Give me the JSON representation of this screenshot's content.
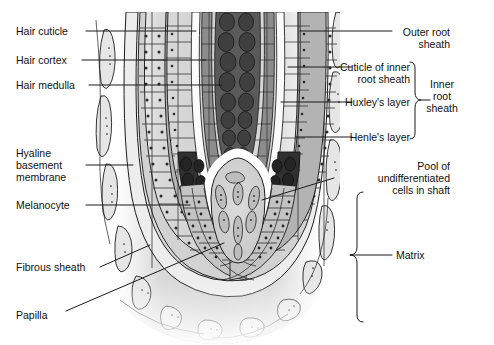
{
  "figure": {
    "type": "anatomical-diagram",
    "background_color": "#ffffff",
    "line_color": "#1a1a1a",
    "palette": {
      "paper": "#ffffff",
      "tissue_field": "#d9d9d9",
      "outer_root_sheath": "#cfcfcf",
      "inner_root_sheath": "#b5b5b5",
      "hair_cuticle_white": "#fdfdfd",
      "hair_cortex": "#8c8c8c",
      "hair_medulla": "#4c4c4c",
      "melanocyte_zone": "#333333",
      "matrix_cells": "#c2c2c2",
      "papilla": "#c9c9c9",
      "fibrous_sheath": "#e2e2e2",
      "nucleus_dot": "#2b2b2b",
      "leader_line": "#1a1a1a"
    }
  },
  "labels_left": [
    {
      "id": "hair-cuticle",
      "text": "Hair cuticle",
      "x": 16,
      "y": 25,
      "lines": [
        "Hair cuticle"
      ]
    },
    {
      "id": "hair-cortex",
      "text": "Hair cortex",
      "x": 16,
      "y": 54,
      "lines": [
        "Hair cortex"
      ]
    },
    {
      "id": "hair-medulla",
      "text": "Hair medulla",
      "x": 16,
      "y": 79,
      "lines": [
        "Hair medulla"
      ]
    },
    {
      "id": "hyaline-basement-membrane",
      "text": "Hyaline basement membrane",
      "x": 16,
      "y": 147,
      "lines": [
        "Hyaline",
        "basement",
        "membrane"
      ]
    },
    {
      "id": "melanocyte",
      "text": "Melanocyte",
      "x": 16,
      "y": 199,
      "lines": [
        "Melanocyte"
      ]
    },
    {
      "id": "fibrous-sheath",
      "text": "Fibrous sheath",
      "x": 16,
      "y": 261,
      "lines": [
        "Fibrous sheath"
      ]
    },
    {
      "id": "papilla",
      "text": "Papilla",
      "x": 16,
      "y": 309,
      "lines": [
        "Papilla"
      ]
    }
  ],
  "labels_right": [
    {
      "id": "outer-root-sheath",
      "text": "Outer root sheath",
      "right": 44,
      "y": 26,
      "lines": [
        "Outer root",
        "sheath"
      ]
    },
    {
      "id": "cuticle-of-inner-root-sheath",
      "text": "Cuticle of inner root sheath",
      "right": 84,
      "y": 61,
      "lines": [
        "Cuticle of inner",
        "root sheath"
      ]
    },
    {
      "id": "huxleys-layer",
      "text": "Huxley's layer",
      "right": 84,
      "y": 96,
      "lines": [
        "Huxley's layer"
      ]
    },
    {
      "id": "henles-layer",
      "text": "Henle's layer",
      "right": 84,
      "y": 131,
      "lines": [
        "Henle's layer"
      ]
    },
    {
      "id": "pool-of-undifferentiated-cells",
      "text": "Pool of undifferentiated cells in shaft",
      "right": 44,
      "y": 160,
      "lines": [
        "Pool of",
        "undifferentiated",
        "cells in shaft"
      ]
    }
  ],
  "brace_labels": [
    {
      "id": "inner-root-sheath",
      "text": "Inner root sheath",
      "x": 432,
      "y": 85,
      "lines": [
        "Inner",
        "root",
        "sheath"
      ],
      "span_top": 62,
      "span_bottom": 139,
      "brace_x": 415,
      "align": "center"
    },
    {
      "id": "matrix",
      "text": "Matrix",
      "x": 398,
      "y": 252,
      "lines": [
        "Matrix"
      ],
      "span_top": 192,
      "span_bottom": 322,
      "brace_x": 357,
      "align": "left"
    }
  ],
  "structures": [
    {
      "id": "hair-shaft-medulla",
      "name": "Hair medulla",
      "note": "central column of dark oval cells"
    },
    {
      "id": "hair-shaft-cortex",
      "name": "Hair cortex",
      "note": "mid-grey elongated columns flanking medulla"
    },
    {
      "id": "hair-shaft-cuticle",
      "name": "Hair cuticle",
      "note": "thin white strips bounding the shaft"
    },
    {
      "id": "inner-root-sheath",
      "name": "Inner root sheath",
      "note": "Henle's layer, Huxley's layer, cuticle of IRS"
    },
    {
      "id": "outer-root-sheath",
      "name": "Outer root sheath",
      "note": "pale polygonal cells with nuclei"
    },
    {
      "id": "hyaline-membrane",
      "name": "Hyaline basement membrane",
      "note": "thin pale band outside ORS"
    },
    {
      "id": "fibrous-sheath",
      "name": "Fibrous sheath",
      "note": "elongated spindle cells, outermost"
    },
    {
      "id": "melanocyte-zone",
      "name": "Melanocyte",
      "note": "very dark arc over the papilla apex"
    },
    {
      "id": "matrix",
      "name": "Matrix",
      "note": "germinative cells around the papilla"
    },
    {
      "id": "dermal-papilla",
      "name": "Papilla",
      "note": "pale dome at base of the bulb"
    }
  ]
}
